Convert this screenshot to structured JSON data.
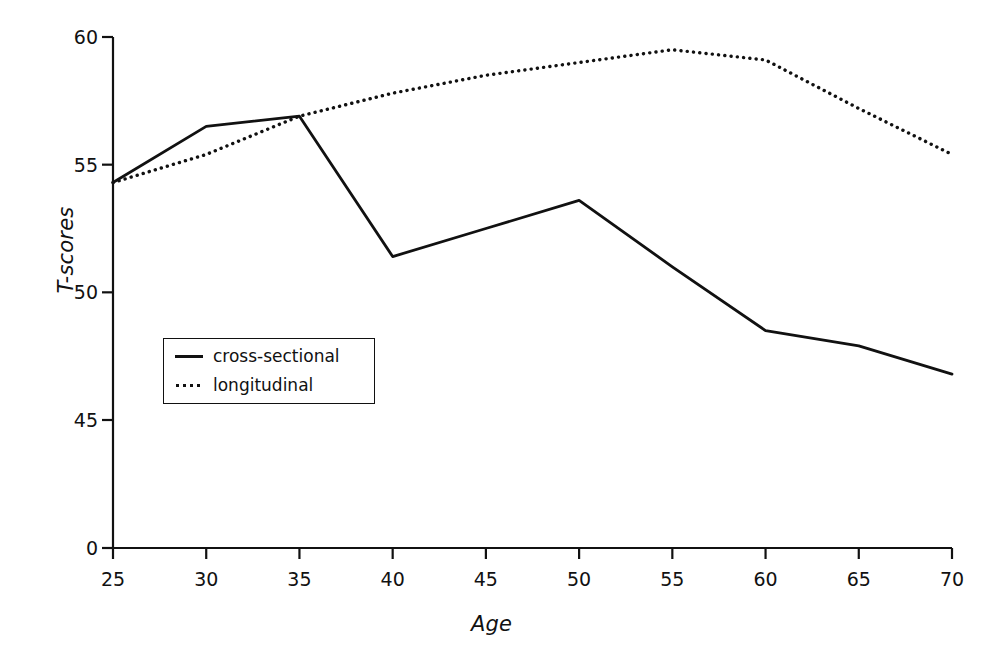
{
  "chart_data": {
    "type": "line",
    "title": "",
    "subtitle": "",
    "xlabel": "Age",
    "ylabel": "T-scores",
    "x": [
      25,
      30,
      35,
      40,
      45,
      50,
      55,
      60,
      65,
      70
    ],
    "xtick_labels": [
      "25",
      "30",
      "35",
      "40",
      "45",
      "50",
      "55",
      "60",
      "65",
      "70"
    ],
    "ytick_labels": [
      "0",
      "45",
      "50",
      "55",
      "60"
    ],
    "ytick_values": [
      0,
      45,
      50,
      55,
      60
    ],
    "xlim": [
      25,
      70
    ],
    "ylim": [
      0,
      60
    ],
    "axis_break": true,
    "axis_break_note": "y-axis broken between 0 and 45",
    "grid": false,
    "legend_position": "inside-left",
    "series": [
      {
        "name": "cross-sectional",
        "style": "solid",
        "color": "#111111",
        "values": [
          54.3,
          56.5,
          56.9,
          51.4,
          52.5,
          53.6,
          51.0,
          48.5,
          47.9,
          46.8
        ]
      },
      {
        "name": "longitudinal",
        "style": "dotted",
        "color": "#111111",
        "values": [
          54.3,
          55.4,
          56.9,
          57.8,
          58.5,
          59.0,
          59.5,
          59.1,
          57.2,
          55.4
        ]
      }
    ]
  },
  "legend": {
    "entries": [
      {
        "label": "cross-sectional",
        "style": "solid"
      },
      {
        "label": "longitudinal",
        "style": "dotted"
      }
    ]
  },
  "colors": {
    "ink": "#111111",
    "background": "#ffffff"
  }
}
